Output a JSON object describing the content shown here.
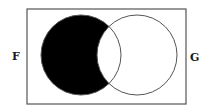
{
  "diagram": {
    "type": "venn",
    "shaded_region": "F only (F minus G)",
    "universe": {
      "x": 27,
      "y": 9,
      "width": 159,
      "height": 95,
      "stroke": "#555555"
    },
    "sets": [
      {
        "label": "F",
        "cx": 81,
        "cy": 55,
        "r": 40,
        "fill": "#000000"
      },
      {
        "label": "G",
        "cx": 137,
        "cy": 55,
        "r": 40,
        "fill": "none"
      }
    ],
    "labels": {
      "F": {
        "text": "F",
        "x": 12,
        "y": 60
      },
      "G": {
        "text": "G",
        "x": 190,
        "y": 61
      }
    },
    "colors": {
      "shade": "#000000",
      "stroke": "#555555",
      "background": "#ffffff"
    }
  }
}
